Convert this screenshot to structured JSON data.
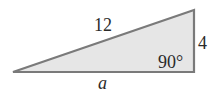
{
  "diagram": {
    "type": "right-triangle",
    "fill_color": "#e6e6e6",
    "stroke_color": "#7a7a7a",
    "vertices": {
      "left": [
        13,
        72
      ],
      "right_bottom": [
        194,
        72
      ],
      "top_right": [
        194,
        10
      ]
    },
    "labels": {
      "hypotenuse": "12",
      "vertical_side": "4",
      "right_angle": "90°",
      "base": "a"
    }
  }
}
